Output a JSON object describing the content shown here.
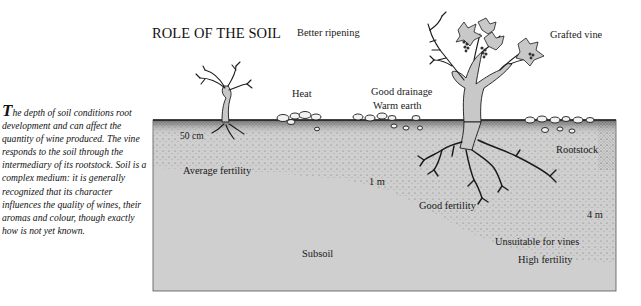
{
  "title": "ROLE OF THE SOIL",
  "caption": {
    "dropcap": "T",
    "text": "he depth of soil conditions root development and can affect the quantity of wine produced. The vine responds to the soil through the intermediary of its rootstock. Soil is a complex medium: it is generally recognized that its character influences the quality of wines, their aromas and colour, though exactly how is not yet known."
  },
  "labels": {
    "better_ripening": "Better ripening",
    "grafted_vine": "Grafted vine",
    "heat": "Heat",
    "good_drainage": "Good drainage",
    "warm_earth": "Warm earth",
    "depth_50cm": "50 cm",
    "average_fertility": "Average fertility",
    "depth_1m": "1 m",
    "rootstock": "Rootstock",
    "good_fertility": "Good fertility",
    "depth_4m": "4 m",
    "unsuitable": "Unsuitable for vines",
    "high_fertility": "High fertility",
    "subsoil": "Subsoil"
  },
  "colors": {
    "soil_fill": "#cfcfcf",
    "topsoil_dark": "#7a7a7a",
    "vine_fill": "#c8c8c8",
    "outline": "#1a1a1a",
    "background": "#ffffff"
  }
}
